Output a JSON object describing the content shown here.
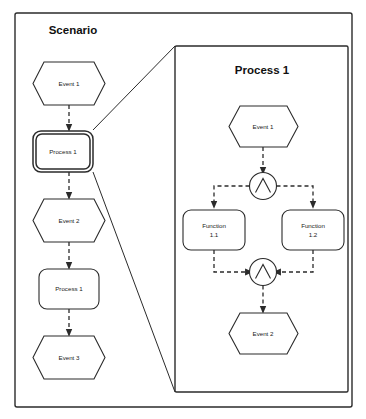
{
  "diagram": {
    "type": "epc-process-drilldown",
    "outer_panel": {
      "title": "Scenario"
    },
    "detail_panel": {
      "title": "Process 1"
    },
    "scenario_nodes": [
      {
        "id": "s-event-1",
        "label": "Event 1",
        "shape": "event",
        "highlighted": false
      },
      {
        "id": "s-process-1",
        "label": "Process 1",
        "shape": "process",
        "highlighted": true
      },
      {
        "id": "s-event-2",
        "label": "Event 2",
        "shape": "event",
        "highlighted": false
      },
      {
        "id": "s-process-2",
        "label": "Process 1",
        "shape": "process",
        "highlighted": false
      },
      {
        "id": "s-event-3",
        "label": "Event 3",
        "shape": "event",
        "highlighted": false
      }
    ],
    "detail_nodes": [
      {
        "id": "d-event-1",
        "label": "Event 1",
        "shape": "event"
      },
      {
        "id": "d-gate-split",
        "label": "AND",
        "shape": "and-connector"
      },
      {
        "id": "d-function-1",
        "label": "Function",
        "label2": "1.1",
        "shape": "function"
      },
      {
        "id": "d-function-2",
        "label": "Function",
        "label2": "1.2",
        "shape": "function"
      },
      {
        "id": "d-gate-join",
        "label": "AND",
        "shape": "and-connector"
      },
      {
        "id": "d-event-2",
        "label": "Event 2",
        "shape": "event"
      }
    ],
    "colors": {
      "stroke": "#2b2b2b",
      "fill": "#ffffff",
      "text": "#1a1a1a"
    }
  }
}
